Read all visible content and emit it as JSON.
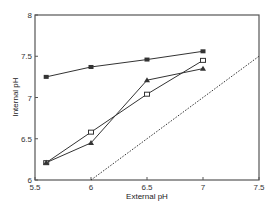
{
  "chart_data": {
    "type": "line",
    "title": "",
    "xlabel": "External pH",
    "ylabel": "Internal pH",
    "xlim": [
      5.5,
      7.5
    ],
    "ylim": [
      6,
      8
    ],
    "xticks": [
      5.5,
      6,
      6.5,
      7,
      7.5
    ],
    "xtick_labels": [
      "5.5",
      "6",
      "6.5",
      "7",
      "7.5"
    ],
    "yticks": [
      6,
      6.5,
      7,
      7.5,
      8
    ],
    "ytick_labels": [
      "6",
      "6.5",
      "7",
      "7.5",
      "8"
    ],
    "grid": false,
    "legend": null,
    "x": [
      5.6,
      6.0,
      6.5,
      7.0
    ],
    "series": [
      {
        "name": "filled-square",
        "marker": "square-filled",
        "line": "solid",
        "values": [
          7.25,
          7.37,
          7.46,
          7.56
        ]
      },
      {
        "name": "open-square",
        "marker": "square-open",
        "line": "solid",
        "values": [
          6.21,
          6.58,
          7.04,
          7.45
        ]
      },
      {
        "name": "filled-triangle",
        "marker": "triangle-filled",
        "line": "solid",
        "values": [
          6.21,
          6.45,
          7.21,
          7.35
        ]
      },
      {
        "name": "identity-line",
        "marker": "none",
        "line": "dotted",
        "x": [
          6.0,
          7.5
        ],
        "values": [
          6.0,
          7.5
        ]
      }
    ]
  },
  "colors": {
    "axis": "#555555",
    "series": "#333333"
  }
}
